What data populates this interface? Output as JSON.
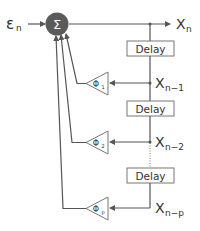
{
  "diagram": {
    "input": {
      "symbol": "ε",
      "subscript": "n"
    },
    "summer": {
      "symbol": "Σ",
      "color": "#555555"
    },
    "output": {
      "symbol": "X",
      "subscript": "n"
    },
    "delays": [
      {
        "label": "Delay"
      },
      {
        "label": "Delay"
      },
      {
        "label": "Delay"
      }
    ],
    "taps": [
      {
        "symbol": "X",
        "subscript": "n−1",
        "coef_symbol": "Φ",
        "coef_subscript": "1"
      },
      {
        "symbol": "X",
        "subscript": "n−2",
        "coef_symbol": "Φ",
        "coef_subscript": "2"
      },
      {
        "symbol": "X",
        "subscript": "n−p",
        "coef_symbol": "Φ",
        "coef_subscript": "p"
      }
    ],
    "colors": {
      "line": "#555555",
      "box_border": "#666666",
      "text": "#333333",
      "background": "#ffffff"
    }
  }
}
